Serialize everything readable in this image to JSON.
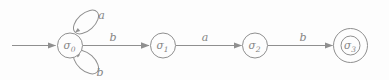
{
  "figure": {
    "type": "finite-state-automaton",
    "colors": {
      "stroke": "#8f8f8f",
      "text": "#858585",
      "background": "#fdfdfd"
    },
    "states": [
      {
        "name": "sigma0",
        "symbol": "σ",
        "subscript": "0",
        "initial": true,
        "accepting": false
      },
      {
        "name": "sigma1",
        "symbol": "σ",
        "subscript": "1",
        "initial": false,
        "accepting": false
      },
      {
        "name": "sigma2",
        "symbol": "σ",
        "subscript": "2",
        "initial": false,
        "accepting": false
      },
      {
        "name": "sigma3",
        "symbol": "σ",
        "subscript": "3",
        "initial": false,
        "accepting": true
      }
    ],
    "transitions": [
      {
        "from": "sigma0",
        "to": "sigma0",
        "label": "a",
        "shape": "self-loop-top"
      },
      {
        "from": "sigma0",
        "to": "sigma0",
        "label": "b",
        "shape": "self-loop-bottom"
      },
      {
        "from": "sigma0",
        "to": "sigma1",
        "label": "b",
        "shape": "straight"
      },
      {
        "from": "sigma1",
        "to": "sigma2",
        "label": "a",
        "shape": "straight"
      },
      {
        "from": "sigma2",
        "to": "sigma3",
        "label": "b",
        "shape": "straight"
      }
    ]
  }
}
